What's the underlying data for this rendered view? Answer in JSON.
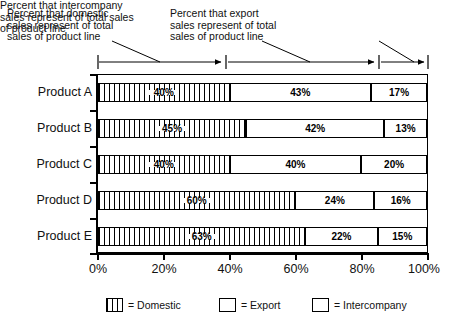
{
  "annotations": [
    {
      "id": "domestic",
      "text": "Percent that domestic\nsales represent of total\nsales of product line"
    },
    {
      "id": "export",
      "text": "Percent that export\nsales represent of total\nsales of product line"
    },
    {
      "id": "intercompany",
      "text": "Percent that intercompany\nsales represent of total sales\nof product line"
    }
  ],
  "axis": {
    "xticks": [
      "0%",
      "20%",
      "40%",
      "60%",
      "80%",
      "100%"
    ]
  },
  "legend": [
    {
      "swatch": "vertical-stripes",
      "label": "= Domestic"
    },
    {
      "swatch": "white",
      "label": "= Export"
    },
    {
      "swatch": "stipple-dots",
      "label": "= Intercompany"
    }
  ],
  "rows": [
    {
      "label": "Product A",
      "segments": [
        {
          "name": "Domestic",
          "value": 40,
          "text": "40%"
        },
        {
          "name": "Export",
          "value": 43,
          "text": "43%"
        },
        {
          "name": "Intercompany",
          "value": 17,
          "text": "17%"
        }
      ]
    },
    {
      "label": "Product B",
      "segments": [
        {
          "name": "Domestic",
          "value": 45,
          "text": "45%"
        },
        {
          "name": "Export",
          "value": 42,
          "text": "42%"
        },
        {
          "name": "Intercompany",
          "value": 13,
          "text": "13%"
        }
      ]
    },
    {
      "label": "Product C",
      "segments": [
        {
          "name": "Domestic",
          "value": 40,
          "text": "40%"
        },
        {
          "name": "Export",
          "value": 40,
          "text": "40%"
        },
        {
          "name": "Intercompany",
          "value": 20,
          "text": "20%"
        }
      ]
    },
    {
      "label": "Product D",
      "segments": [
        {
          "name": "Domestic",
          "value": 60,
          "text": "60%"
        },
        {
          "name": "Export",
          "value": 24,
          "text": "24%"
        },
        {
          "name": "Intercompany",
          "value": 16,
          "text": "16%"
        }
      ]
    },
    {
      "label": "Product E",
      "segments": [
        {
          "name": "Domestic",
          "value": 63,
          "text": "63%"
        },
        {
          "name": "Export",
          "value": 22,
          "text": "22%"
        },
        {
          "name": "Intercompany",
          "value": 15,
          "text": "15%"
        }
      ]
    }
  ],
  "chart_data": {
    "type": "bar",
    "orientation": "horizontal",
    "stacked": true,
    "normalized": "100%",
    "title": "",
    "xlabel": "",
    "ylabel": "",
    "xlim": [
      0,
      100
    ],
    "grid": false,
    "legend_position": "bottom",
    "categories": [
      "Product A",
      "Product B",
      "Product C",
      "Product D",
      "Product E"
    ],
    "xtick_labels": [
      "0%",
      "20%",
      "40%",
      "60%",
      "80%",
      "100%"
    ],
    "xtick_values": [
      0,
      20,
      40,
      60,
      80,
      100
    ],
    "series": [
      {
        "name": "Domestic",
        "values": [
          40,
          43,
          40,
          60,
          63
        ]
      },
      {
        "name": "Export",
        "values": [
          43,
          42,
          40,
          24,
          22
        ]
      },
      {
        "name": "Intercompany",
        "values": [
          17,
          13,
          20,
          16,
          15
        ]
      }
    ],
    "data_labels": [
      [
        "40%",
        "43%",
        "17%"
      ],
      [
        "45%",
        "42%",
        "13%"
      ],
      [
        "40%",
        "40%",
        "20%"
      ],
      [
        "60%",
        "24%",
        "16%"
      ],
      [
        "63%",
        "22%",
        "15%"
      ]
    ],
    "annotations": [
      "Percent that domestic sales represent of total sales of product line",
      "Percent that export sales represent of total sales of product line",
      "Percent that intercompany sales represent of total sales of product line"
    ],
    "note": "Series 'Domestic' values per category are 40,45,40,60,63"
  }
}
